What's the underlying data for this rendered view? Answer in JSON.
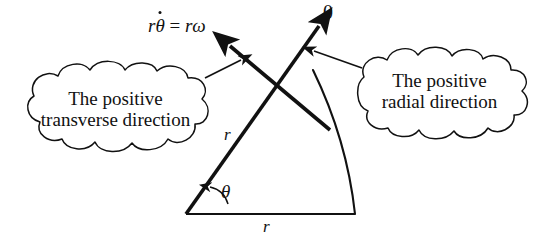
{
  "figure": {
    "type": "polar-coordinate-unit-vector-diagram",
    "background_color": "#ffffff",
    "stroke_color": "#111111",
    "width": 543,
    "height": 244
  },
  "labels": {
    "transverse_expression": {
      "prefix_r": "r",
      "theta_dot": "θ",
      "equals": "=",
      "r_omega": "rω",
      "full_text": "rθ̇ = rω"
    },
    "origin_zero": "0",
    "radius_radial": "r",
    "radius_base": "r",
    "angle": "θ"
  },
  "callouts": [
    {
      "id": "transverse",
      "line1": "The positive",
      "line2": "transverse direction",
      "shape": "cloud",
      "points_to": "transverse-arrow"
    },
    {
      "id": "radial",
      "line1": "The positive",
      "line2": "radial direction",
      "shape": "cloud",
      "points_to": "radial-arrow"
    }
  ],
  "geometry": {
    "origin": [
      186,
      214
    ],
    "base_end": [
      355,
      214
    ],
    "radial_arrow_tip": [
      322,
      22
    ],
    "transverse_arrow_tip": [
      225,
      42
    ],
    "lines_cross": [
      278,
      83
    ],
    "arc_from": [
      313,
      70
    ],
    "arc_to": [
      355,
      214
    ],
    "angle_arc_label": "θ"
  }
}
